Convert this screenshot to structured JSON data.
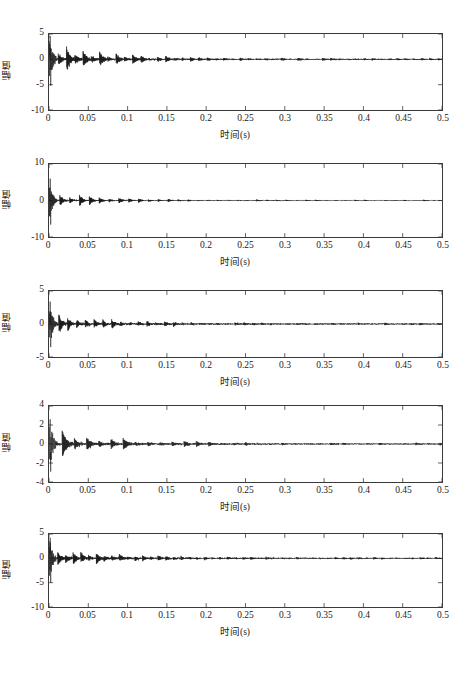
{
  "figure": {
    "width": 470,
    "height": 677,
    "background": "#ffffff",
    "axis_color": "#3a3a3a",
    "line_color": "#141414"
  },
  "chart_data": [
    {
      "type": "line",
      "title": "",
      "index": 1,
      "xlabel": "时间(s)",
      "ylabel": "幅值",
      "xlim": [
        0,
        0.5
      ],
      "ylim": [
        -10,
        5
      ],
      "xticks": [
        0,
        0.05,
        0.1,
        0.15,
        0.2,
        0.25,
        0.3,
        0.35,
        0.4,
        0.45,
        0.5
      ],
      "xticklabels": [
        "0",
        "0.05",
        "0.1",
        "0.15",
        "0.2",
        "0.25",
        "0.3",
        "0.35",
        "0.4",
        "0.45",
        "0.5"
      ],
      "yticks": [
        5,
        0,
        -5,
        -10
      ],
      "yticklabels": [
        "5",
        "0",
        "-5",
        "-10"
      ],
      "grid": false,
      "legend": null,
      "series_description": "impulse-modulated vibration signal, decaying periodic bursts",
      "seed": 11,
      "carrier_hz": 1850,
      "burst_period_s": 0.0105,
      "burst_decay": 220,
      "initial_spike": -5.2,
      "initial_spike_pos": 4.6,
      "envelope_decay": 13.0,
      "noise_level": 0.11,
      "peak_amp": 2.2,
      "tail_amp": 0.16
    },
    {
      "type": "line",
      "title": "",
      "index": 2,
      "xlabel": "时间(s)",
      "ylabel": "幅值",
      "xlim": [
        0,
        0.5
      ],
      "ylim": [
        -10,
        10
      ],
      "xticks": [
        0,
        0.05,
        0.1,
        0.15,
        0.2,
        0.25,
        0.3,
        0.35,
        0.4,
        0.45,
        0.5
      ],
      "xticklabels": [
        "0",
        "0.05",
        "0.1",
        "0.15",
        "0.2",
        "0.25",
        "0.3",
        "0.35",
        "0.4",
        "0.45",
        "0.5"
      ],
      "yticks": [
        10,
        0,
        -10
      ],
      "yticklabels": [
        "10",
        "0",
        "-10"
      ],
      "grid": false,
      "legend": null,
      "series_description": "impulse-modulated vibration signal, strong initial transient",
      "seed": 27,
      "carrier_hz": 2100,
      "burst_period_s": 0.0125,
      "burst_decay": 260,
      "initial_spike": -6.6,
      "initial_spike_pos": 6.0,
      "envelope_decay": 16.0,
      "noise_level": 0.09,
      "peak_amp": 2.0,
      "tail_amp": 0.12
    },
    {
      "type": "line",
      "title": "",
      "index": 3,
      "xlabel": "时间(s)",
      "ylabel": "幅值",
      "xlim": [
        0,
        0.5
      ],
      "ylim": [
        -5,
        5
      ],
      "xticks": [
        0,
        0.05,
        0.1,
        0.15,
        0.2,
        0.25,
        0.3,
        0.35,
        0.4,
        0.45,
        0.5
      ],
      "xticklabels": [
        "0",
        "0.05",
        "0.1",
        "0.15",
        "0.2",
        "0.25",
        "0.3",
        "0.35",
        "0.4",
        "0.45",
        "0.5"
      ],
      "yticks": [
        5,
        0,
        -5
      ],
      "yticklabels": [
        "5",
        "0",
        "-5"
      ],
      "grid": false,
      "legend": null,
      "series_description": "impulse-modulated vibration signal, symmetric envelope",
      "seed": 43,
      "carrier_hz": 1950,
      "burst_period_s": 0.0112,
      "burst_decay": 240,
      "initial_spike": -3.5,
      "initial_spike_pos": 3.4,
      "envelope_decay": 15.0,
      "noise_level": 0.1,
      "peak_amp": 1.4,
      "tail_amp": 0.1
    },
    {
      "type": "line",
      "title": "",
      "index": 4,
      "xlabel": "时间(s)",
      "ylabel": "幅值",
      "xlim": [
        0,
        0.5
      ],
      "ylim": [
        -4,
        4
      ],
      "xticks": [
        0,
        0.05,
        0.1,
        0.15,
        0.2,
        0.25,
        0.3,
        0.35,
        0.4,
        0.45,
        0.5
      ],
      "xticklabels": [
        "0",
        "0.05",
        "0.1",
        "0.15",
        "0.2",
        "0.25",
        "0.3",
        "0.35",
        "0.4",
        "0.45",
        "0.5"
      ],
      "yticks": [
        4,
        2,
        0,
        -2,
        -4
      ],
      "yticklabels": [
        "4",
        "2",
        "0",
        "-2",
        "-4"
      ],
      "grid": false,
      "legend": null,
      "series_description": "impulse-modulated vibration signal, clear discrete bursts",
      "seed": 61,
      "carrier_hz": 1500,
      "burst_period_s": 0.0155,
      "burst_decay": 180,
      "initial_spike": -2.9,
      "initial_spike_pos": 2.6,
      "envelope_decay": 12.0,
      "noise_level": 0.07,
      "peak_amp": 1.05,
      "tail_amp": 0.07
    },
    {
      "type": "line",
      "title": "",
      "index": 5,
      "xlabel": "时间(s)",
      "ylabel": "幅值",
      "xlim": [
        0,
        0.5
      ],
      "ylim": [
        -10,
        5
      ],
      "xticks": [
        0,
        0.05,
        0.1,
        0.15,
        0.2,
        0.25,
        0.3,
        0.35,
        0.4,
        0.45,
        0.5
      ],
      "xticklabels": [
        "0",
        "0.05",
        "0.1",
        "0.15",
        "0.2",
        "0.25",
        "0.3",
        "0.35",
        "0.4",
        "0.45",
        "0.5"
      ],
      "yticks": [
        5,
        0,
        -5,
        -10
      ],
      "yticklabels": [
        "5",
        "0",
        "-5",
        "-10"
      ],
      "grid": false,
      "legend": null,
      "series_description": "impulse-modulated vibration signal, dense mid-band activity",
      "seed": 89,
      "carrier_hz": 2000,
      "burst_period_s": 0.0098,
      "burst_decay": 250,
      "initial_spike": -5.0,
      "initial_spike_pos": 4.2,
      "envelope_decay": 14.0,
      "noise_level": 0.12,
      "peak_amp": 1.9,
      "tail_amp": 0.15
    }
  ]
}
